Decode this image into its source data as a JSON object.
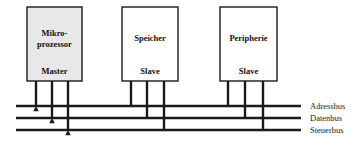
{
  "diagram": {
    "background_color": "#ffffff",
    "line_color": "#1a1a1a",
    "units": [
      {
        "id": "mikroprozessor",
        "name_line1": "Mikro-",
        "name_line2": "prozessor",
        "role": "Master",
        "fill": "#e8e8e8",
        "stroke": "#1a1a1a",
        "x": 27,
        "y": 7,
        "width": 55,
        "height": 74,
        "arrow_direction": "down",
        "stems": [
          36,
          52,
          68
        ]
      },
      {
        "id": "speicher",
        "name_line1": "Speicher",
        "name_line2": "",
        "role": "Slave",
        "fill": "#ffffff",
        "stroke": "#1a1a1a",
        "x": 122,
        "y": 7,
        "width": 56,
        "height": 74,
        "arrow_direction": "up",
        "stems": [
          131,
          147,
          164
        ]
      },
      {
        "id": "peripherie",
        "name_line1": "Peripherie",
        "name_line2": "",
        "role": "Slave",
        "fill": "#ffffff",
        "stroke": "#1a1a1a",
        "x": 220,
        "y": 7,
        "width": 57,
        "height": 74,
        "arrow_direction": "up",
        "stems": [
          228,
          245,
          263
        ]
      }
    ],
    "buses": [
      {
        "id": "adressbus",
        "label": "Adressbus",
        "y": 106,
        "x_start": 16,
        "x_end": 301
      },
      {
        "id": "datenbus",
        "label": "Datenbus",
        "y": 118,
        "x_start": 16,
        "x_end": 301
      },
      {
        "id": "steuerbus",
        "label": "Steuerbus",
        "y": 130,
        "x_start": 16,
        "x_end": 301
      }
    ],
    "label_x": 310
  }
}
